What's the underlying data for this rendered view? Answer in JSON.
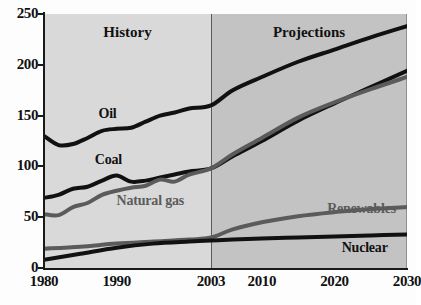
{
  "chart_data": {
    "type": "line",
    "title": "",
    "xlabel": "",
    "ylabel": "",
    "ylim": [
      0,
      250
    ],
    "yticks": [
      0,
      50,
      100,
      150,
      200,
      250
    ],
    "xticks": [
      1980,
      1990,
      2003,
      2010,
      2020,
      2030
    ],
    "xtick_labels": [
      "1980",
      "1990",
      "2003",
      "2010",
      "2020",
      "2030"
    ],
    "grid": false,
    "legend_position": "inline-labels",
    "annotations": [
      {
        "text": "History",
        "x": 1991.5,
        "note": "zone caption left of 2003 divider"
      },
      {
        "text": "Projections",
        "x": 2016.5,
        "note": "zone caption right of 2003 divider"
      }
    ],
    "vertical_divider": {
      "x": 2003,
      "label": "2003"
    },
    "series": [
      {
        "name": "Oil",
        "color": "#111111",
        "x": [
          1980,
          1982,
          1984,
          1986,
          1988,
          1990,
          1992,
          1994,
          1996,
          1998,
          2000,
          2003,
          2006,
          2010,
          2015,
          2020,
          2025,
          2030
        ],
        "values": [
          130,
          121,
          122,
          128,
          135,
          137,
          138,
          144,
          150,
          153,
          157,
          160,
          175,
          188,
          203,
          215,
          227,
          238
        ]
      },
      {
        "name": "Coal",
        "color": "#111111",
        "x": [
          1980,
          1982,
          1984,
          1986,
          1988,
          1990,
          1992,
          1994,
          1996,
          1998,
          2000,
          2003,
          2006,
          2010,
          2015,
          2020,
          2025,
          2030
        ],
        "values": [
          69,
          72,
          78,
          80,
          86,
          91,
          85,
          86,
          89,
          92,
          95,
          98,
          110,
          125,
          145,
          162,
          178,
          194
        ]
      },
      {
        "name": "Natural gas",
        "color": "#5b5b5b",
        "x": [
          1980,
          1982,
          1984,
          1986,
          1988,
          1990,
          1992,
          1994,
          1996,
          1998,
          2000,
          2003,
          2006,
          2010,
          2015,
          2020,
          2025,
          2030
        ],
        "values": [
          53,
          52,
          60,
          64,
          72,
          76,
          79,
          81,
          87,
          85,
          92,
          98,
          112,
          128,
          148,
          163,
          176,
          188
        ]
      },
      {
        "name": "Renewables",
        "color": "#5b5b5b",
        "x": [
          1980,
          1985,
          1990,
          1995,
          2000,
          2003,
          2006,
          2010,
          2015,
          2020,
          2025,
          2030
        ],
        "values": [
          19,
          21,
          24,
          26,
          28,
          30,
          38,
          45,
          51,
          55,
          58,
          60
        ]
      },
      {
        "name": "Nuclear",
        "color": "#111111",
        "x": [
          1980,
          1985,
          1990,
          1995,
          2000,
          2003,
          2006,
          2010,
          2015,
          2020,
          2025,
          2030
        ],
        "values": [
          8,
          14,
          20,
          24,
          26,
          27,
          28,
          29,
          30,
          31,
          32,
          33
        ]
      }
    ],
    "series_label_positions": [
      {
        "name": "Oil",
        "x": 1987.5,
        "y": 152
      },
      {
        "name": "Coal",
        "x": 1987.0,
        "y": 106
      },
      {
        "name": "Natural gas",
        "x": 1990.0,
        "y": 66
      },
      {
        "name": "Renewables",
        "x": 2019.0,
        "y": 58
      },
      {
        "name": "Nuclear",
        "x": 2021.0,
        "y": 20
      }
    ]
  },
  "axis": {
    "y_labels": [
      "250",
      "200",
      "150",
      "100",
      "50",
      "0"
    ],
    "x_labels": [
      "1980",
      "1990",
      "2003",
      "2010",
      "2020",
      "2030"
    ]
  },
  "zones": {
    "history_label": "History",
    "projections_label": "Projections"
  },
  "series_labels": {
    "oil": "Oil",
    "coal": "Coal",
    "natural_gas": "Natural gas",
    "renewables": "Renewables",
    "nuclear": "Nuclear"
  },
  "colors": {
    "dark_series": "#111111",
    "grey_series": "#5b5b5b",
    "history_band": "#d9d9d9",
    "projection_band": "#c3c3c3",
    "axis": "#1a1a1a",
    "divider": "#5a5a5a"
  }
}
